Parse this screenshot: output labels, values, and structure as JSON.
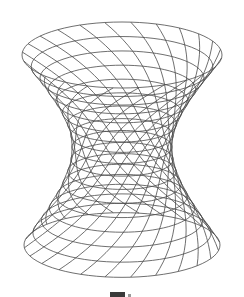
{
  "figure": {
    "title": "",
    "stroke_color": "#4a4a4a",
    "background": "#ffffff",
    "geometry": {
      "center_x": 122,
      "top_y": 55,
      "waist_y": 147,
      "bottom_y": 245,
      "top_radius_x": 100,
      "waist_radius_x": 50,
      "bottom_radius_x": 98,
      "ellipse_ratio": 0.33,
      "rings": 17,
      "rulings": 24,
      "twist_deg": 70
    }
  },
  "caption": {
    "text": ""
  }
}
